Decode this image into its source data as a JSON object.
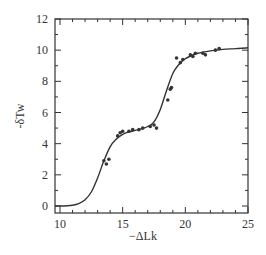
{
  "chart_data": {
    "type": "scatter",
    "title": "",
    "xlabel": "−ΔLk",
    "ylabel": "-δTw",
    "xlim": [
      9.5,
      25
    ],
    "ylim": [
      -0.5,
      12
    ],
    "xticks": [
      10,
      15,
      20,
      25
    ],
    "yticks": [
      0,
      2,
      4,
      6,
      8,
      10,
      12
    ],
    "grid": false,
    "legend": null,
    "series": [
      {
        "name": "measured",
        "type": "scatter",
        "x": [
          13.5,
          13.7,
          13.9,
          14.6,
          14.8,
          15.0,
          15.5,
          15.8,
          16.3,
          16.6,
          17.2,
          17.5,
          17.7,
          18.6,
          18.8,
          18.9,
          19.3,
          19.6,
          19.8,
          20.4,
          20.6,
          20.8,
          21.4,
          21.6,
          22.4,
          22.7
        ],
        "y": [
          2.9,
          2.7,
          3.0,
          4.5,
          4.7,
          4.8,
          4.8,
          4.9,
          4.9,
          5.0,
          5.1,
          5.2,
          5.0,
          6.8,
          7.5,
          7.6,
          9.5,
          9.2,
          9.4,
          9.7,
          9.6,
          9.8,
          9.8,
          9.7,
          10.0,
          10.1
        ]
      },
      {
        "name": "fit",
        "type": "line",
        "x": [
          9.5,
          10,
          11,
          11.5,
          12,
          12.5,
          13,
          13.5,
          14,
          14.5,
          15,
          15.5,
          16,
          16.5,
          17,
          17.5,
          18,
          18.5,
          19,
          19.5,
          20,
          20.5,
          21,
          22,
          23,
          24,
          25
        ],
        "y": [
          0,
          0,
          0.05,
          0.15,
          0.4,
          0.9,
          1.8,
          2.9,
          3.8,
          4.3,
          4.6,
          4.75,
          4.85,
          4.95,
          5.1,
          5.4,
          6.2,
          7.4,
          8.5,
          9.1,
          9.45,
          9.65,
          9.8,
          9.95,
          10.05,
          10.1,
          10.15
        ]
      }
    ]
  }
}
